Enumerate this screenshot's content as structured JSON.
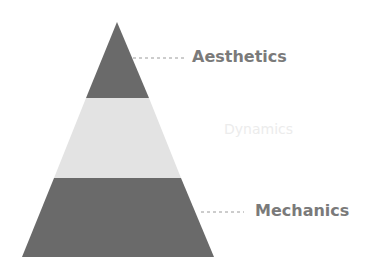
{
  "diagram": {
    "type": "pyramid",
    "layers": [
      {
        "name": "Aesthetics",
        "position": "top",
        "fill": "#6a6a6a"
      },
      {
        "name": "Dynamics",
        "position": "middle",
        "fill": "#e3e3e3"
      },
      {
        "name": "Mechanics",
        "position": "bottom",
        "fill": "#6a6a6a"
      }
    ],
    "labels": {
      "aesthetics": "Aesthetics",
      "dynamics": "Dynamics",
      "mechanics": "Mechanics"
    },
    "colors": {
      "dark_layer": "#6a6a6a",
      "light_layer": "#e3e3e3",
      "label_text": "#7a7a7a",
      "faded_label_text": "#ececec",
      "leader_line": "#9a9a9a"
    }
  }
}
